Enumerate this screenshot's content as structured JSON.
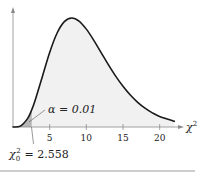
{
  "chart_data": {
    "type": "area",
    "title": "",
    "distribution": "chi-square",
    "degrees_of_freedom": 10,
    "xlabel": "χ²",
    "ylabel": "",
    "xlim": [
      0,
      22.5
    ],
    "x_ticks": [
      5,
      10,
      15,
      20
    ],
    "x_tick_labels": [
      "5",
      "10",
      "15",
      "20"
    ],
    "grid": false,
    "legend": null,
    "series": [
      {
        "name": "chi-square pdf (df=10)",
        "x": [
          0,
          1,
          2,
          2.558,
          3,
          4,
          5,
          6,
          7,
          8,
          9,
          10,
          11,
          12,
          13,
          14,
          15,
          16,
          17,
          18,
          19,
          20,
          22
        ],
        "values": [
          0,
          0.0008,
          0.0077,
          0.0155,
          0.0235,
          0.0451,
          0.0668,
          0.084,
          0.0944,
          0.0977,
          0.0949,
          0.0877,
          0.0779,
          0.0669,
          0.0559,
          0.0456,
          0.0365,
          0.0286,
          0.0221,
          0.0169,
          0.0127,
          0.0095,
          0.0051
        ]
      }
    ],
    "shaded_region": {
      "from": 0,
      "to": 2.558,
      "label": "α = 0.01",
      "tail": "left"
    },
    "annotations": [
      {
        "text": "α = 0.01",
        "target": "left-tail area"
      },
      {
        "text": "χ₀² = 2.558",
        "target": "critical value on x-axis"
      }
    ]
  },
  "labels": {
    "alpha_prefix": "α = 0.01",
    "critical_symbol": "χ",
    "critical_sub": "0",
    "critical_sup": "2",
    "critical_value": "= 2.558",
    "axis_symbol": "χ",
    "axis_sup": "2",
    "ticks": [
      "5",
      "10",
      "15",
      "20"
    ]
  },
  "colors": {
    "curve": "#1a1a1a",
    "body_fill": "#f1f1f1",
    "tail_fill": "#b8b8b8",
    "axis": "#8a8a8a",
    "bottom_rule": "#bdbdbd"
  }
}
